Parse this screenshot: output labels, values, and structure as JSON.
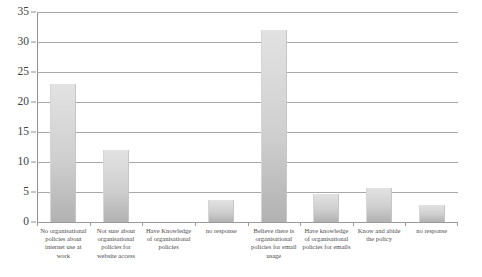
{
  "chart_data": {
    "type": "bar",
    "title": "",
    "xlabel": "",
    "ylabel": "",
    "ylim": [
      0,
      35
    ],
    "yticks": [
      0,
      5,
      10,
      15,
      20,
      25,
      30,
      35
    ],
    "grid": true,
    "legend": "none",
    "categories": [
      "No organisational policies about internet use at work",
      "Not sure about organisational policies for website access",
      "Have Knowledge of organisational policies",
      "no response",
      "Believe there is organisational policies for email usage",
      "Have knowledge of organisational policies for emails",
      "Know and abide the policy",
      "no response"
    ],
    "values": [
      23,
      12,
      0,
      3.6,
      32,
      4.7,
      5.7,
      2.8
    ],
    "series": [
      {
        "name": "Responses",
        "values": [
          23,
          12,
          0,
          3.6,
          32,
          4.7,
          5.7,
          2.8
        ]
      }
    ],
    "colors": {
      "bar_top": "#e2e2e2",
      "bar_bottom": "#b2b2b2",
      "gridline": "#a9a9a9",
      "axis": "#8f8f8f",
      "text": "#3f3f3f",
      "background": "#ffffff"
    }
  }
}
